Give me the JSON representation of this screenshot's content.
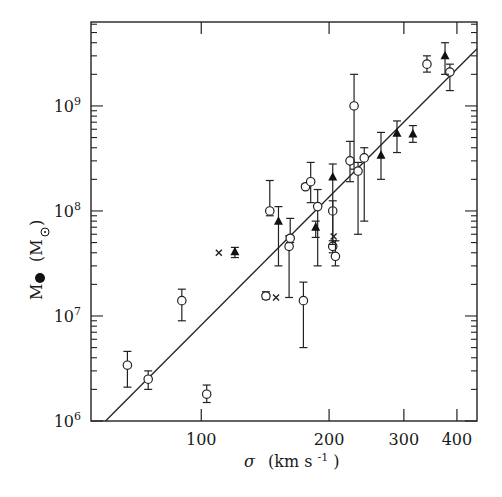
{
  "chart_data": {
    "type": "scatter",
    "title": "",
    "xlabel": "σ (km s⁻¹)",
    "ylabel": "M● (M☉)",
    "xscale": "log",
    "yscale": "log",
    "xlim": [
      55,
      446
    ],
    "ylim": [
      1000000,
      6300000000
    ],
    "x_ticks": [
      100,
      200,
      300,
      400
    ],
    "x_tick_labels": [
      "100",
      "200",
      "300",
      "400"
    ],
    "y_ticks": [
      1000000,
      10000000,
      100000000,
      1000000000
    ],
    "y_tick_labels": [
      {
        "base": "10",
        "exp": "6"
      },
      {
        "base": "10",
        "exp": "7"
      },
      {
        "base": "10",
        "exp": "8"
      },
      {
        "base": "10",
        "exp": "9"
      }
    ],
    "grid": false,
    "legend": null,
    "series": [
      {
        "name": "open circles",
        "marker": "circle-open",
        "points": [
          {
            "x": 67,
            "y": 3400000,
            "ylo": 2100000,
            "yhi": 4600000
          },
          {
            "x": 75,
            "y": 2500000,
            "ylo": 2000000,
            "yhi": 3000000
          },
          {
            "x": 90,
            "y": 14000000,
            "ylo": 9000000,
            "yhi": 18000000
          },
          {
            "x": 103,
            "y": 1800000,
            "ylo": 1500000,
            "yhi": 2200000
          },
          {
            "x": 142,
            "y": 15500000,
            "ylo": 14500000,
            "yhi": 17000000
          },
          {
            "x": 145,
            "y": 100000000,
            "ylo": 90000000,
            "yhi": 195000000
          },
          {
            "x": 161,
            "y": 46000000,
            "ylo": 15000000,
            "yhi": 58000000
          },
          {
            "x": 162,
            "y": 55000000,
            "ylo": 50000000,
            "yhi": 85000000
          },
          {
            "x": 174,
            "y": 14000000,
            "ylo": 5000000,
            "yhi": 21000000
          },
          {
            "x": 176,
            "y": 170000000,
            "ylo": 165000000,
            "yhi": 180000000
          },
          {
            "x": 181,
            "y": 190000000,
            "ylo": 120000000,
            "yhi": 290000000
          },
          {
            "x": 188,
            "y": 110000000,
            "ylo": 30000000,
            "yhi": 160000000
          },
          {
            "x": 204,
            "y": 100000000,
            "ylo": 45000000,
            "yhi": 125000000
          },
          {
            "x": 204,
            "y": 46000000,
            "ylo": 40000000,
            "yhi": 52000000
          },
          {
            "x": 207,
            "y": 37000000,
            "ylo": 30000000,
            "yhi": 52000000
          },
          {
            "x": 224,
            "y": 300000000,
            "ylo": 190000000,
            "yhi": 460000000
          },
          {
            "x": 229,
            "y": 1000000000,
            "ylo": 250000000,
            "yhi": 2000000000
          },
          {
            "x": 234,
            "y": 240000000,
            "ylo": 60000000,
            "yhi": 290000000
          },
          {
            "x": 242,
            "y": 320000000,
            "ylo": 80000000,
            "yhi": 400000000
          },
          {
            "x": 340,
            "y": 2500000000,
            "ylo": 2100000000,
            "yhi": 3000000000
          },
          {
            "x": 385,
            "y": 2100000000,
            "ylo": 1400000000,
            "yhi": 2500000000
          }
        ]
      },
      {
        "name": "filled triangles",
        "marker": "triangle-filled",
        "points": [
          {
            "x": 120,
            "y": 41000000,
            "ylo": 36000000,
            "yhi": 45000000
          },
          {
            "x": 152,
            "y": 80000000,
            "ylo": 30000000,
            "yhi": 110000000
          },
          {
            "x": 186,
            "y": 70000000,
            "ylo": 56000000,
            "yhi": 80000000
          },
          {
            "x": 204,
            "y": 210000000,
            "ylo": 48000000,
            "yhi": 280000000
          },
          {
            "x": 265,
            "y": 340000000,
            "ylo": 200000000,
            "yhi": 560000000
          },
          {
            "x": 289,
            "y": 550000000,
            "ylo": 360000000,
            "yhi": 720000000
          },
          {
            "x": 315,
            "y": 540000000,
            "ylo": 450000000,
            "yhi": 650000000
          },
          {
            "x": 375,
            "y": 3000000000,
            "ylo": 2000000000,
            "yhi": 4000000000
          }
        ]
      },
      {
        "name": "crosses",
        "marker": "x",
        "points": [
          {
            "x": 110,
            "y": 40000000
          },
          {
            "x": 150,
            "y": 15000000
          },
          {
            "x": 205,
            "y": 57000000
          }
        ]
      },
      {
        "name": "fit line",
        "type": "line",
        "points": [
          {
            "x": 59.5,
            "y": 1000000
          },
          {
            "x": 446,
            "y": 3500000000
          }
        ]
      }
    ]
  },
  "axes": {
    "x_label_symbol": "σ",
    "x_label_units": "(km s",
    "x_label_exp": "-1",
    "x_label_close": ")",
    "y_label_main": "M",
    "y_label_units_open": "(M",
    "y_label_units_close": ")"
  }
}
